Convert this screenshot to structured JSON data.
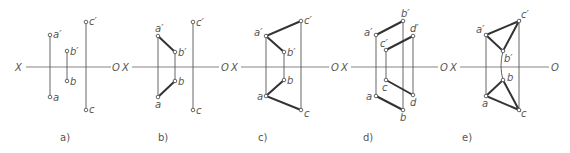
{
  "figure": {
    "axis_labels": {
      "left": "X",
      "right": "O"
    },
    "panels": [
      {
        "caption": "a)",
        "points": {
          "a1": {
            "label": "a′",
            "x": 50,
            "y": 35
          },
          "b1": {
            "label": "b′",
            "x": 67,
            "y": 51
          },
          "c1": {
            "label": "c′",
            "x": 86,
            "y": 22
          },
          "a": {
            "label": "a",
            "x": 50,
            "y": 97
          },
          "b": {
            "label": "b",
            "x": 67,
            "y": 81
          },
          "c": {
            "label": "c",
            "x": 86,
            "y": 110
          }
        }
      },
      {
        "caption": "b)",
        "points": {
          "a1": {
            "label": "a′",
            "x": 158,
            "y": 36
          },
          "b1": {
            "label": "b′",
            "x": 175,
            "y": 52
          },
          "c1": {
            "label": "c′",
            "x": 193,
            "y": 22
          },
          "a": {
            "label": "a",
            "x": 158,
            "y": 97
          },
          "b": {
            "label": "b",
            "x": 175,
            "y": 81
          },
          "c": {
            "label": "c",
            "x": 193,
            "y": 110
          }
        }
      },
      {
        "caption": "c)",
        "points": {
          "a1": {
            "label": "a′",
            "x": 266,
            "y": 36
          },
          "b1": {
            "label": "b′",
            "x": 284,
            "y": 52
          },
          "c1": {
            "label": "c′",
            "x": 301,
            "y": 21
          },
          "a": {
            "label": "a",
            "x": 266,
            "y": 96
          },
          "b": {
            "label": "b",
            "x": 284,
            "y": 80
          },
          "c": {
            "label": "c",
            "x": 301,
            "y": 110
          }
        }
      },
      {
        "caption": "d)",
        "points": {
          "a1": {
            "label": "a′",
            "x": 376,
            "y": 35
          },
          "b1": {
            "label": "b′",
            "x": 403,
            "y": 21
          },
          "c1": {
            "label": "c′",
            "x": 386,
            "y": 50
          },
          "d1": {
            "label": "d′",
            "x": 413,
            "y": 36
          },
          "a": {
            "label": "a",
            "x": 376,
            "y": 96
          },
          "b": {
            "label": "b",
            "x": 403,
            "y": 110
          },
          "c": {
            "label": "c",
            "x": 386,
            "y": 80
          },
          "d": {
            "label": "d",
            "x": 413,
            "y": 95
          }
        }
      },
      {
        "caption": "e)",
        "points": {
          "a1": {
            "label": "a′",
            "x": 486,
            "y": 35
          },
          "b1": {
            "label": "b′",
            "x": 503,
            "y": 51
          },
          "c1": {
            "label": "c′",
            "x": 519,
            "y": 21
          },
          "a": {
            "label": "a",
            "x": 486,
            "y": 96
          },
          "b": {
            "label": "b",
            "x": 503,
            "y": 80
          },
          "c": {
            "label": "c",
            "x": 519,
            "y": 110
          }
        }
      }
    ]
  }
}
